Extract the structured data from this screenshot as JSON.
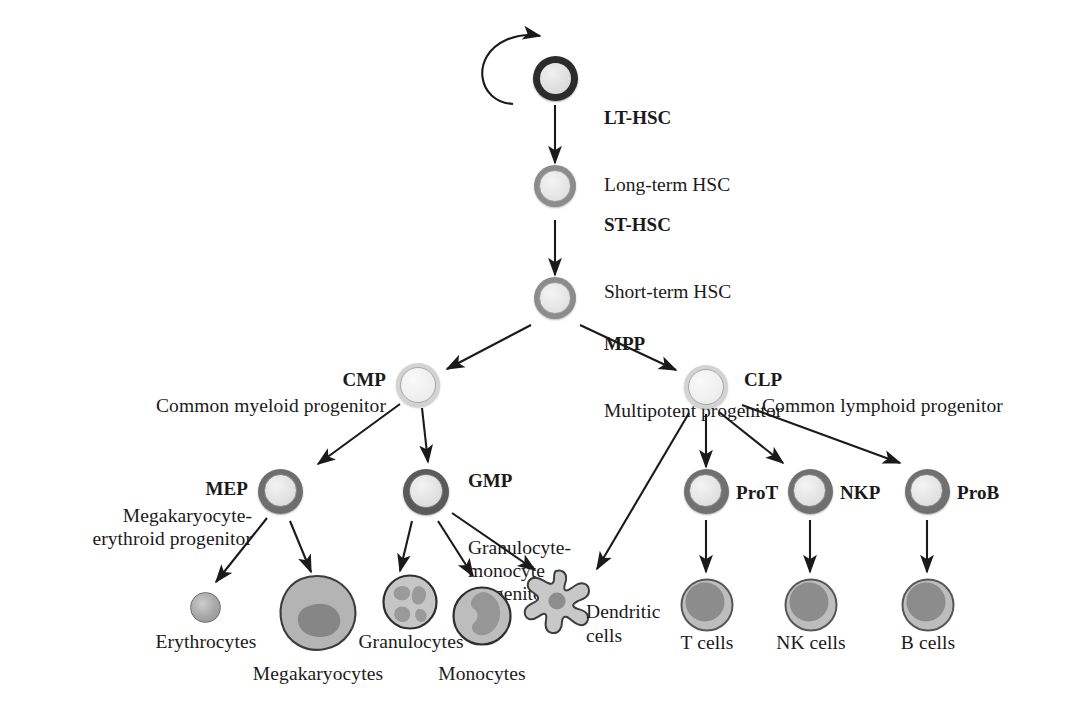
{
  "diagram": {
    "background_color": "#ffffff",
    "line_color": "#1a1a1a"
  },
  "nodes": {
    "lt_hsc": {
      "abbr": "LT-HSC",
      "full": "Long-term HSC",
      "ring_color": "#2b2b2b",
      "fill_color": "#dcdcdc"
    },
    "st_hsc": {
      "abbr": "ST-HSC",
      "full": "Short-term HSC",
      "ring_color": "#8c8c8c",
      "fill_color": "#e3e3e3"
    },
    "mpp": {
      "abbr": "MPP",
      "full": "Multipotent progenitor",
      "ring_color": "#8c8c8c",
      "fill_color": "#e3e3e3"
    },
    "cmp": {
      "abbr": "CMP",
      "full": "Common myeloid progenitor",
      "ring_color": "#c4c4c4",
      "fill_color": "#ededed"
    },
    "clp": {
      "abbr": "CLP",
      "full": "Common lymphoid progenitor",
      "ring_color": "#c4c4c4",
      "fill_color": "#ededed"
    },
    "mep": {
      "abbr": "MEP",
      "full": "Megakaryocyte-\nerythroid progenitor",
      "ring_color": "#6e6e6e",
      "fill_color": "#dedede"
    },
    "gmp": {
      "abbr": "GMP",
      "full": "Granulocyte-\nmonocyte\nprogenitor",
      "ring_color": "#5a5a5a",
      "fill_color": "#dedede"
    },
    "prot": {
      "abbr": "ProT",
      "full": "",
      "ring_color": "#707070",
      "fill_color": "#e0e0e0"
    },
    "nkp": {
      "abbr": "NKP",
      "full": "",
      "ring_color": "#707070",
      "fill_color": "#e0e0e0"
    },
    "prob": {
      "abbr": "ProB",
      "full": "",
      "ring_color": "#707070",
      "fill_color": "#e0e0e0"
    }
  },
  "terminal_cells": {
    "erythrocytes": {
      "label": "Erythrocytes",
      "color": "#9a9a9a"
    },
    "megakaryocytes": {
      "label": "Megakaryocytes",
      "color": "#b0b0b0",
      "nucleus_color": "#808080"
    },
    "granulocytes": {
      "label": "Granulocytes",
      "color": "#c0c0c0",
      "nucleus_color": "#959595"
    },
    "monocytes": {
      "label": "Monocytes",
      "color": "#b5b5b5",
      "nucleus_color": "#949494"
    },
    "dendritic": {
      "label": "Dendritic\ncells",
      "color": "#c2c2c2",
      "nucleus_color": "#8f8f8f"
    },
    "t_cells": {
      "label": "T cells",
      "color": "#b8b8b8",
      "nucleus_color": "#8a8a8a"
    },
    "nk_cells": {
      "label": "NK cells",
      "color": "#b8b8b8",
      "nucleus_color": "#8a8a8a"
    },
    "b_cells": {
      "label": "B cells",
      "color": "#b8b8b8",
      "nucleus_color": "#8a8a8a"
    }
  },
  "edges": [
    {
      "from": "lt_hsc",
      "to": "lt_hsc",
      "kind": "self-renewal"
    },
    {
      "from": "lt_hsc",
      "to": "st_hsc",
      "kind": "straight"
    },
    {
      "from": "st_hsc",
      "to": "mpp",
      "kind": "straight"
    },
    {
      "from": "mpp",
      "to": "cmp",
      "kind": "diagonal"
    },
    {
      "from": "mpp",
      "to": "clp",
      "kind": "diagonal"
    },
    {
      "from": "cmp",
      "to": "mep",
      "kind": "diagonal"
    },
    {
      "from": "cmp",
      "to": "gmp",
      "kind": "straight"
    },
    {
      "from": "mep",
      "to": "erythrocytes",
      "kind": "diagonal"
    },
    {
      "from": "mep",
      "to": "megakaryocytes",
      "kind": "diagonal"
    },
    {
      "from": "gmp",
      "to": "granulocytes",
      "kind": "diagonal"
    },
    {
      "from": "gmp",
      "to": "monocytes",
      "kind": "diagonal"
    },
    {
      "from": "gmp",
      "to": "dendritic",
      "kind": "diagonal"
    },
    {
      "from": "clp",
      "to": "dendritic",
      "kind": "diagonal"
    },
    {
      "from": "clp",
      "to": "prot",
      "kind": "straight"
    },
    {
      "from": "clp",
      "to": "nkp",
      "kind": "diagonal"
    },
    {
      "from": "clp",
      "to": "prob",
      "kind": "diagonal"
    },
    {
      "from": "prot",
      "to": "t_cells",
      "kind": "straight"
    },
    {
      "from": "nkp",
      "to": "nk_cells",
      "kind": "straight"
    },
    {
      "from": "prob",
      "to": "b_cells",
      "kind": "straight"
    }
  ]
}
